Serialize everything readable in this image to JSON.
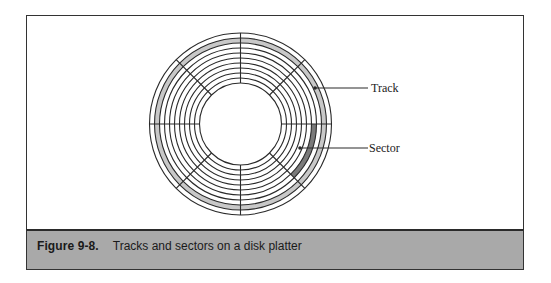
{
  "figure": {
    "number": "Figure 9-8.",
    "caption": "Tracks and sectors on a disk platter"
  },
  "diagram": {
    "labels": {
      "track": "Track",
      "sector": "Sector"
    },
    "platter": {
      "center": [
        240.5,
        124
      ],
      "outer_radius": 91,
      "inner_radius": 41,
      "ring_count": 11,
      "sector_divisions": 8
    },
    "highlighted_track": {
      "band_index_from_outside": 1,
      "color": "#c8c8c8"
    },
    "highlighted_sector": {
      "band_index_from_outside": 3,
      "start_angle_deg": 0,
      "end_angle_deg": 45,
      "color": "#7a7a7a"
    }
  },
  "colors": {
    "line": "#2a2a2a",
    "caption_bar": "#a9a9a9",
    "frame_border": "#333333"
  }
}
